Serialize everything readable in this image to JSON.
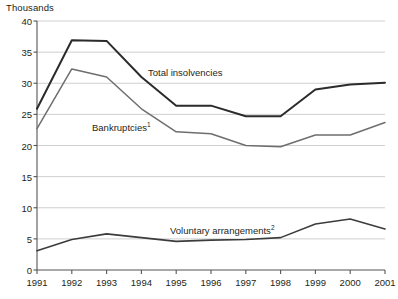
{
  "axis_unit_label": "Thousands",
  "colors": {
    "total_insolvencies": "#2b2b2b",
    "bankruptcies": "#6e6e6e",
    "voluntary_arrangements": "#3c3c3c",
    "gridline": "#c9c9c9",
    "axis": "#555555",
    "text": "#231f20",
    "background": "#ffffff"
  },
  "annotations": {
    "total_insolvencies": {
      "label": "Total insolvencies",
      "x": 148,
      "y": 67
    },
    "bankruptcies": {
      "label": "Bankruptcies",
      "superscript": "1",
      "x": 92,
      "y": 122
    },
    "voluntary_arrangements": {
      "label": "Voluntary arrangements",
      "superscript": "2",
      "x": 170,
      "y": 225
    }
  },
  "chart_data": {
    "type": "line",
    "title": "",
    "subtitle": "",
    "xlabel": "",
    "ylabel": "Thousands",
    "ylim": [
      0,
      40
    ],
    "y_ticks": [
      0,
      5,
      10,
      15,
      20,
      25,
      30,
      35,
      40
    ],
    "y_tick_labels": [
      "0",
      "5",
      "10",
      "15",
      "20",
      "25",
      "30",
      "35",
      "40"
    ],
    "grid": true,
    "legend": "inline-annotations",
    "categories": [
      "1991",
      "1992",
      "1993",
      "1994",
      "1995",
      "1996",
      "1997",
      "1998",
      "1999",
      "2000",
      "2001"
    ],
    "x": [
      1991,
      1992,
      1993,
      1994,
      1995,
      1996,
      1997,
      1998,
      1999,
      2000,
      2001
    ],
    "series": [
      {
        "name": "Total insolvencies",
        "values": [
          25.9,
          36.9,
          36.8,
          31.0,
          26.4,
          26.4,
          24.7,
          24.7,
          29.0,
          29.8,
          30.1
        ]
      },
      {
        "name": "Bankruptcies",
        "values": [
          22.7,
          32.3,
          31.0,
          25.9,
          22.2,
          21.9,
          20.0,
          19.8,
          21.7,
          21.7,
          23.7
        ]
      },
      {
        "name": "Voluntary arrangements",
        "values": [
          3.1,
          4.9,
          5.8,
          5.2,
          4.6,
          4.8,
          4.9,
          5.2,
          7.4,
          8.2,
          6.6
        ]
      }
    ]
  }
}
